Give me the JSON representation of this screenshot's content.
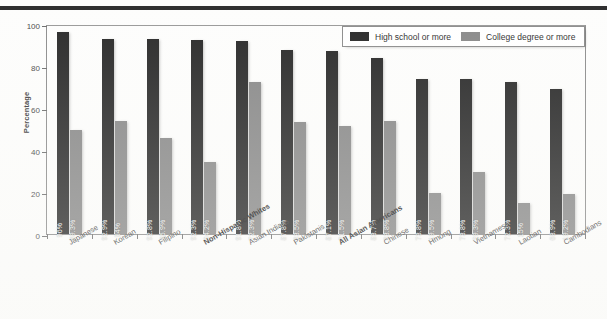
{
  "chart_data": {
    "type": "bar",
    "title": "",
    "subtitle": "",
    "xlabel": "",
    "ylabel": "Percentage",
    "ylim": [
      0,
      100
    ],
    "yticks": [
      0,
      20,
      40,
      60,
      80,
      100
    ],
    "grid": false,
    "legend_position": "top-right",
    "categories": [
      "Japanese",
      "Korean",
      "Filipino",
      "Non-Hispanic Whites",
      "Asian Indians",
      "Pakistanis",
      "All Asian Americans",
      "Chinese",
      "Hmong",
      "Vietnamese",
      "Laotian",
      "Cambodians"
    ],
    "emphasized_categories": [
      "Non-Hispanic Whites",
      "All Asian Americans"
    ],
    "series": [
      {
        "name": "High school or more",
        "color": "#2b2b2b",
        "values": [
          96,
          92.9,
          92.8,
          92.3,
          91.8,
          87.8,
          87.1,
          83.7,
          73.8,
          73.8,
          72.3,
          68.9
        ],
        "labels": [
          "96%",
          "92.9%",
          "92.8%",
          "92.3%",
          "91.8%",
          "87.8%",
          "87.1%",
          "83.7%",
          "73.8%",
          "73.8%",
          "72.3%",
          "68.9%"
        ]
      },
      {
        "name": "College degree or more",
        "color": "#8a8a8a",
        "values": [
          49.3,
          54,
          45.9,
          34.2,
          72.3,
          53.5,
          51.5,
          53.8,
          19.5,
          29.3,
          15,
          19.2
        ],
        "labels": [
          "49.3%",
          "54%",
          "45.9%",
          "34.2%",
          "72.3%",
          "53.5%",
          "51.5%",
          "53.8%",
          "19.5%",
          "29.3%",
          "15%",
          "19.2%"
        ]
      }
    ]
  },
  "legend": {
    "items": [
      {
        "label": "High school or more",
        "swatch": "hs"
      },
      {
        "label": "College degree or more",
        "swatch": "cd"
      }
    ]
  },
  "axis": {
    "y_title": "Percentage",
    "y_tick_labels": [
      "100",
      "80",
      "60",
      "40",
      "20",
      "0"
    ]
  }
}
